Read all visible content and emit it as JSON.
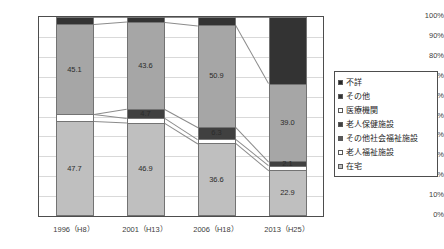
{
  "chart_data": {
    "type": "bar",
    "subtype": "100-percent-stacked-column",
    "title": "",
    "xlabel": "",
    "ylabel": "",
    "ylim": [
      0,
      100
    ],
    "ytick_labels": [
      "100%",
      "90%",
      "80%",
      "70%",
      "60%",
      "50%",
      "40%",
      "30%",
      "20%",
      "10%",
      "0%"
    ],
    "ytick_values": [
      100,
      90,
      80,
      70,
      60,
      50,
      40,
      30,
      20,
      10,
      0
    ],
    "grid": true,
    "legend_position": "right",
    "categories": [
      "1996（H8）",
      "2001（H13）",
      "2006（H18）",
      "2013（H25）"
    ],
    "series": [
      {
        "name": "在宅",
        "color": "#bfbfbf",
        "values": [
          47.7,
          46.9,
          36.6,
          22.9
        ],
        "labels": [
          "47.7",
          "46.9",
          "36.6",
          "22.9"
        ]
      },
      {
        "name": "老人福祉施設",
        "color": "#ffffff",
        "values": [
          3.6,
          2.4,
          2.0,
          2.4
        ],
        "labels": [
          "",
          "",
          "",
          ""
        ]
      },
      {
        "name": "その他社会福祉施設",
        "color": "#595959",
        "values": [
          0.0,
          0.0,
          0.0,
          0.0
        ],
        "labels": [
          "",
          "",
          "",
          ""
        ]
      },
      {
        "name": "老人保健施設",
        "color": "#404040",
        "values": [
          0.0,
          4.7,
          6.3,
          2.1
        ],
        "labels": [
          "",
          "4.7",
          "6.3",
          "2.1"
        ]
      },
      {
        "name": "医療機関",
        "color": "#a6a6a6",
        "values": [
          45.1,
          43.6,
          50.9,
          39.0
        ],
        "labels": [
          "45.1",
          "43.6",
          "50.9",
          "39.0"
        ]
      },
      {
        "name": "その他",
        "color": "#333333",
        "values": [
          3.6,
          2.4,
          4.2,
          33.6
        ],
        "labels": [
          "",
          "",
          "",
          ""
        ]
      },
      {
        "name": "不詳",
        "color": "#262626",
        "values": [
          0.0,
          0.0,
          0.0,
          0.0
        ],
        "labels": [
          "",
          "",
          "",
          ""
        ]
      }
    ],
    "legend_entries": [
      {
        "label": "不詳",
        "color": "#262626"
      },
      {
        "label": "その他",
        "color": "#333333"
      },
      {
        "label": "医療機関",
        "color": "#ffffff"
      },
      {
        "label": "老人保健施設",
        "color": "#404040"
      },
      {
        "label": "その他社会福祉施設",
        "color": "#595959"
      },
      {
        "label": "老人福祉施設",
        "color": "#ffffff"
      },
      {
        "label": "在宅",
        "color": "#bfbfbf"
      }
    ]
  }
}
